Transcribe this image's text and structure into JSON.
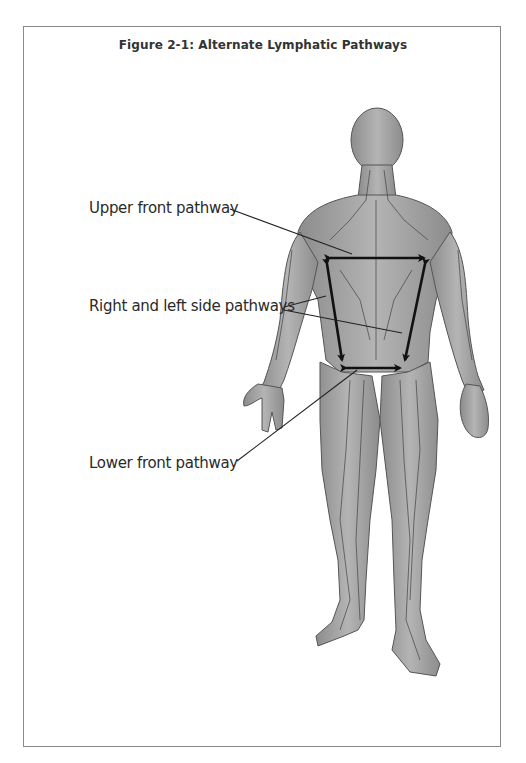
{
  "figure": {
    "title": "Figure  2-1:  Alternate Lymphatic Pathways",
    "labels": {
      "upper_front": "Upper front pathway",
      "right_left_side": "Right and left side pathways",
      "lower_front": "Lower front pathway"
    },
    "colors": {
      "frame": "#8a8a8a",
      "body_fill": "#9a9a9a",
      "arrow": "#111111",
      "text": "#2a2a2a"
    }
  }
}
